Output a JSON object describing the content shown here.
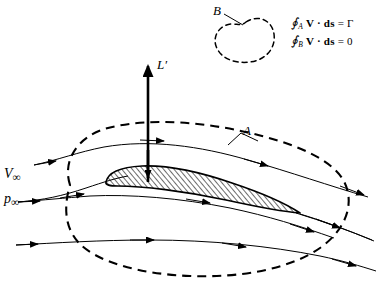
{
  "figure": {
    "width": 387,
    "height": 285,
    "background_color": "#ffffff",
    "ink_color": "#000000"
  },
  "labels": {
    "lift": "L",
    "lift_prime": "′",
    "contour_a": "A",
    "contour_b": "B",
    "velocity_symbol": "V",
    "pressure_symbol": "p",
    "infinity": "∞"
  },
  "equations": [
    {
      "id": "circulation-a",
      "integral": "∮",
      "subscript": "A",
      "vector": "V",
      "operator": "·",
      "element": "ds",
      "equals": "=",
      "result": "Γ",
      "plain": "∮_A V · ds = Γ"
    },
    {
      "id": "circulation-b",
      "integral": "∮",
      "subscript": "B",
      "vector": "V",
      "operator": "·",
      "element": "ds",
      "equals": "=",
      "result": "0",
      "plain": "∮_B V · ds = 0"
    }
  ],
  "diagram_elements": {
    "airfoil": {
      "name": "airfoil-section",
      "fill": "hatched",
      "hatch_angle_deg": 45,
      "leading_edge": "rounded-left",
      "trailing_edge": "sharp-right"
    },
    "lift_arrow": {
      "name": "lift-vector-arrow",
      "direction": "up",
      "label": "L′",
      "stroke_width": 2.6
    },
    "contour_a_curve": {
      "name": "contour-a-dashed-loop",
      "style": "dashed",
      "encloses": "airfoil"
    },
    "contour_b_curve": {
      "name": "contour-b-dashed-loop",
      "style": "dashed",
      "encloses": "nothing"
    },
    "streamlines": {
      "name": "streamline-group",
      "count": 6,
      "style": "solid-with-arrowheads",
      "flow_direction": "left-to-right"
    }
  }
}
